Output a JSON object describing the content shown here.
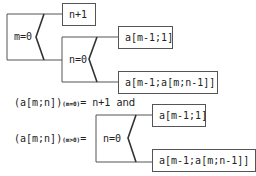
{
  "diagram": {
    "top": {
      "cond_m": "m=0",
      "result_n_plus_1": "n+1",
      "cond_n": "n=0",
      "result_a_m1_1": "a[m-1;1]",
      "result_a_recursive": "a[m-1;a[m;n-1]]"
    },
    "bottom": {
      "formula1_lhs": "(a[m;n])",
      "formula1_sub": "(m=0)",
      "formula1_eq": "=",
      "formula1_rhs": "n+1",
      "formula1_and": "and",
      "formula2_lhs": "(a[m;n])",
      "formula2_sub": "(m>0)",
      "formula2_eq": "=",
      "cond_n": "n=0",
      "result_a_m1_1": "a[m-1;1]",
      "result_a_recursive": "a[m-1;a[m;n-1]]"
    }
  },
  "colors": {
    "line": "#555555",
    "zigzag": "#333333",
    "text": "#222222"
  }
}
